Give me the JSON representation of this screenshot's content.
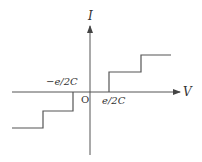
{
  "diagram": {
    "type": "coulomb-blockade-iv-staircase",
    "axes": {
      "x_label": "V",
      "y_label": "I",
      "origin_label": "O"
    },
    "annotations": {
      "negative_threshold": "−e/2C",
      "positive_threshold": "e/2C"
    },
    "colors": {
      "line": "#555555",
      "text": "#333333",
      "background": "#ffffff"
    },
    "staircase": {
      "positive_branch": "steps up at V = e/2C, then again further right",
      "negative_branch": "steps down at V = −e/2C, then again further left"
    }
  }
}
